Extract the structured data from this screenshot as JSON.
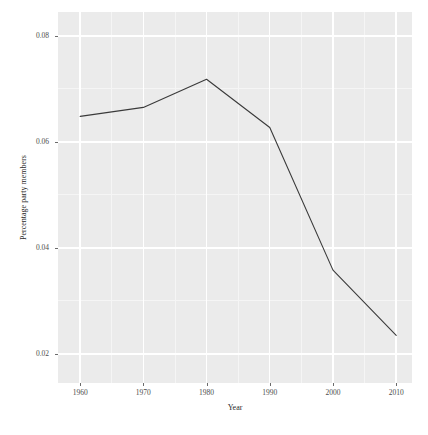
{
  "chart_data": {
    "type": "line",
    "title": "",
    "subtitle": "",
    "xlabel": "Year",
    "ylabel": "Percentage party members",
    "x": [
      1960,
      1970,
      1980,
      1990,
      2000,
      2010
    ],
    "values": [
      0.0648,
      0.0665,
      0.0718,
      0.0627,
      0.0358,
      0.0235
    ],
    "series": [
      {
        "name": "Percentage party members",
        "values": [
          0.0648,
          0.0665,
          0.0718,
          0.0627,
          0.0358,
          0.0235
        ]
      }
    ],
    "xlim": [
      1956.5,
      2012.5
    ],
    "ylim": [
      0.0145,
      0.0845
    ],
    "x_ticks": [
      1960,
      1970,
      1980,
      1990,
      2000,
      2010
    ],
    "x_tick_labels": [
      "1960",
      "1970",
      "1980",
      "1990",
      "2000",
      "2010"
    ],
    "y_ticks": [
      0.02,
      0.04,
      0.06,
      0.08
    ],
    "y_tick_labels": [
      "0.02",
      "0.04",
      "0.06",
      "0.08"
    ],
    "y_minor_ticks": [
      0.03,
      0.05,
      0.07
    ],
    "x_minor_ticks": [
      1965,
      1975,
      1985,
      1995,
      2005
    ],
    "grid": true,
    "legend": null,
    "legend_position": "none",
    "annotations": [],
    "colors": {
      "panel_background": "#ebebeb",
      "figure_background": "#ffffff",
      "major_gridline": "#ffffff",
      "minor_gridline": "#f5f5f5",
      "line": "#3a3a3a",
      "axis_text": "#4d4d4d",
      "axis_title": "#2b2b2b"
    },
    "line_width": 1.1
  },
  "axes": {
    "x_title": "Year",
    "y_title": "Percentage party members"
  }
}
